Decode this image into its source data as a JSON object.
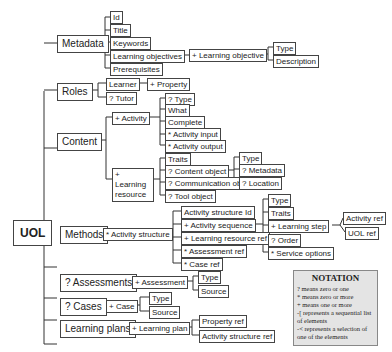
{
  "root": "UOL",
  "metadata": {
    "label": "Metadata",
    "children": [
      "Id",
      "Title",
      "Keywords",
      "Learning objectives",
      "Prerequisites"
    ],
    "learning_objective": "+ Learning objective",
    "lo_children": [
      "Type",
      "Description"
    ]
  },
  "roles": {
    "label": "Roles",
    "learner": "Learner",
    "property": "+ Property",
    "tutor": "? Tutor"
  },
  "content": {
    "label": "Content",
    "activity": "+ Activity",
    "activity_children": [
      "? Type",
      "What",
      "Complete",
      "* Activity input",
      "* Activity output"
    ],
    "learning_resource": "+ Learning resource",
    "resource_children": [
      "Traits",
      "? Content object",
      "? Communication object",
      "? Tool object"
    ],
    "content_object_children": [
      "Type",
      "? Metadata",
      "? Location"
    ]
  },
  "methods": {
    "label": "Methods",
    "activity_structure": "* Activity structure",
    "structure_children": [
      "Activity structure Id",
      "+ Activity sequence",
      "+ Learning resource ref",
      "* Assessment ref",
      "* Case ref"
    ],
    "sequence_children": [
      "Type",
      "Traits",
      "+ Learning step",
      "? Order",
      "* Service options"
    ],
    "step_children": [
      "Activity ref",
      "UOL ref"
    ]
  },
  "assessments": {
    "label": "? Assessments",
    "assessment": "+ Assessment",
    "children": [
      "Type",
      "Source"
    ]
  },
  "cases": {
    "label": "? Cases",
    "case": "+ Case",
    "children": [
      "Type",
      "Source"
    ]
  },
  "plans": {
    "label": "Learning plans",
    "plan": "+ Learning plan",
    "children": [
      "Property ref",
      "Activity structure ref"
    ]
  },
  "notation": {
    "title": "NOTATION",
    "lines": [
      "?  means zero or one",
      "*  means zero or more",
      "+  means one or more",
      "-[  represents a sequential list of elements",
      "-<  represents a selection of one of the elements"
    ]
  }
}
